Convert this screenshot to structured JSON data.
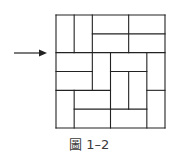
{
  "figure": {
    "caption": "圖 1–2",
    "grid": {
      "rows": 6,
      "cols": 6,
      "origin_px": [
        56,
        15
      ],
      "size_px": [
        109,
        113
      ],
      "stroke_color": "#222222",
      "horizontal_segments": [
        {
          "row": 0,
          "from": 0,
          "to": 6
        },
        {
          "row": 1,
          "from": 2,
          "to": 6
        },
        {
          "row": 2,
          "from": 0,
          "to": 6
        },
        {
          "row": 3,
          "from": 0,
          "to": 2
        },
        {
          "row": 3,
          "from": 3,
          "to": 5
        },
        {
          "row": 4,
          "from": 0,
          "to": 3
        },
        {
          "row": 4,
          "from": 5,
          "to": 6
        },
        {
          "row": 5,
          "from": 1,
          "to": 5
        },
        {
          "row": 6,
          "from": 0,
          "to": 6
        }
      ],
      "vertical_segments": [
        {
          "col": 0,
          "from": 0,
          "to": 6
        },
        {
          "col": 1,
          "from": 0,
          "to": 2
        },
        {
          "col": 1,
          "from": 4,
          "to": 6
        },
        {
          "col": 2,
          "from": 0,
          "to": 4
        },
        {
          "col": 3,
          "from": 2,
          "to": 6
        },
        {
          "col": 4,
          "from": 0,
          "to": 2
        },
        {
          "col": 4,
          "from": 3,
          "to": 5
        },
        {
          "col": 5,
          "from": 2,
          "to": 6
        },
        {
          "col": 6,
          "from": 0,
          "to": 6
        }
      ]
    },
    "arrow": {
      "icon": "right-arrow-icon",
      "direction": "right",
      "points_to_row_boundary": 2
    }
  }
}
